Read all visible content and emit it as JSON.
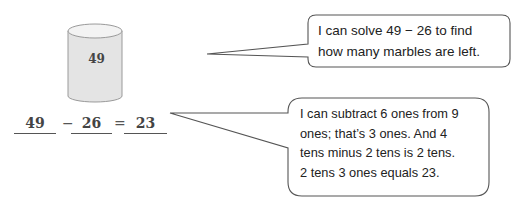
{
  "figure": {
    "jar": {
      "label": "49",
      "fill": "#e6e6e6",
      "stroke": "#999999"
    },
    "equation": {
      "minuend": "49",
      "operator": "−",
      "subtrahend": "26",
      "equals": "=",
      "difference": "23"
    },
    "bubbles": [
      {
        "text_lines": [
          "I can solve 49 − 26 to find",
          "how many marbles are left."
        ]
      },
      {
        "text_lines": [
          "I can subtract 6 ones from 9",
          "ones; that’s 3 ones.  And 4",
          "tens minus 2 tens is 2 tens.",
          "2 tens 3 ones equals 23."
        ]
      }
    ]
  }
}
